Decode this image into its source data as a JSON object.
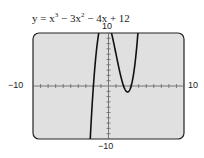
{
  "equation": {
    "prefix": "y = x",
    "exp1": "3",
    "mid1": " − 3x",
    "exp2": "2",
    "rest": " − 4x + 12"
  },
  "labels": {
    "ymax": "10",
    "ymin": "−10",
    "xmin": "−10",
    "xmax": "10"
  },
  "chart_data": {
    "type": "line",
    "xlabel": "",
    "ylabel": "",
    "xlim": [
      -10,
      10
    ],
    "ylim": [
      -10,
      10
    ],
    "xscale_ticks": 1,
    "yscale_ticks": 1,
    "grid": false,
    "series": [
      {
        "name": "y = x^3 − 3x^2 − 4x + 12",
        "function": "x^3 - 3x^2 - 4x + 12",
        "x": [
          -3.0,
          -2.5,
          -2.0,
          -1.5,
          -1.0,
          -0.5,
          0.0,
          0.5,
          1.0,
          1.5,
          2.0,
          2.5,
          3.0,
          3.5
        ],
        "y": [
          -30,
          -13.1,
          0,
          8.6,
          12,
          12.9,
          12,
          10.1,
          8,
          4.9,
          0,
          -0.9,
          0,
          4.9
        ]
      }
    ],
    "zeros": [
      -2,
      2,
      3
    ],
    "background": "#e0e0e0"
  }
}
